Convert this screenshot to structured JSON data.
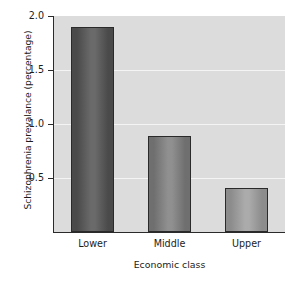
{
  "chart_data": {
    "type": "bar",
    "title": "",
    "categories": [
      "Lower",
      "Middle",
      "Upper"
    ],
    "values": [
      1.9,
      0.89,
      0.41
    ],
    "xlabel": "Economic class",
    "ylabel": "Schizophrenia prevalance (percentage)",
    "ylim": [
      0,
      2.0
    ],
    "yticks": [
      0.5,
      1.0,
      1.5,
      2.0
    ],
    "ytick_labels": [
      "0.5",
      "1.0",
      "1.5",
      "2.0"
    ],
    "grid": true,
    "grid_color": "#f4f4f4",
    "legend": "none",
    "plot_background": "#dcdcdc",
    "figure_background": "#ffffff",
    "axis_color": "#2a2a2a",
    "bar_colors": [
      "#4a4a4a",
      "#6f6f6f",
      "#8c8c8c"
    ],
    "bar_highlight_colors": [
      "#6a6a6a",
      "#909090",
      "#ababab"
    ]
  }
}
